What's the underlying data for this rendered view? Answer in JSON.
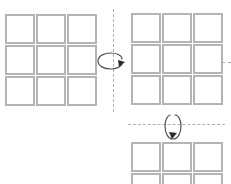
{
  "diagram": {
    "type": "cube-rotation-sequence",
    "background_color": "#ffffff",
    "grid_line_color": "#b4b4b4",
    "axis_line_color": "#b0b0b0",
    "arrow_color": "#333333",
    "grids": [
      {
        "id": "grid-start",
        "label": "",
        "rows": 3,
        "cols": 3,
        "x": 5,
        "y": 14,
        "width": 92,
        "height": 92,
        "clipped": false,
        "cells": [
          {
            "r": 0,
            "c": 0,
            "fill": "#ffffff"
          },
          {
            "r": 0,
            "c": 1,
            "fill": "#ffffff"
          },
          {
            "r": 0,
            "c": 2,
            "fill": "#ffffff"
          },
          {
            "r": 1,
            "c": 0,
            "fill": "#ffffff"
          },
          {
            "r": 1,
            "c": 1,
            "fill": "#ffffff"
          },
          {
            "r": 1,
            "c": 2,
            "fill": "#ffffff"
          },
          {
            "r": 2,
            "c": 0,
            "fill": "#ffffff"
          },
          {
            "r": 2,
            "c": 1,
            "fill": "#ffffff"
          },
          {
            "r": 2,
            "c": 2,
            "fill": "#ffffff"
          }
        ]
      },
      {
        "id": "grid-after-vertical-rotation",
        "label": "",
        "rows": 3,
        "cols": 3,
        "x": 131,
        "y": 13,
        "width": 92,
        "height": 92,
        "clipped": false,
        "cells": [
          {
            "r": 0,
            "c": 0,
            "fill": "#ffffff"
          },
          {
            "r": 0,
            "c": 1,
            "fill": "#ffffff"
          },
          {
            "r": 0,
            "c": 2,
            "fill": "#ffffff"
          },
          {
            "r": 1,
            "c": 0,
            "fill": "#ffffff"
          },
          {
            "r": 1,
            "c": 1,
            "fill": "#ffffff"
          },
          {
            "r": 1,
            "c": 2,
            "fill": "#ffffff"
          },
          {
            "r": 2,
            "c": 0,
            "fill": "#ffffff"
          },
          {
            "r": 2,
            "c": 1,
            "fill": "#ffffff"
          },
          {
            "r": 2,
            "c": 2,
            "fill": "#ffffff"
          }
        ]
      },
      {
        "id": "grid-after-horizontal-rotation",
        "label": "",
        "rows": 3,
        "cols": 3,
        "x": 131,
        "y": 142,
        "width": 92,
        "height": 92,
        "clipped": true,
        "cells": [
          {
            "r": 0,
            "c": 0,
            "fill": "#ffffff"
          },
          {
            "r": 0,
            "c": 1,
            "fill": "#ffffff"
          },
          {
            "r": 0,
            "c": 2,
            "fill": "#ffffff"
          },
          {
            "r": 1,
            "c": 0,
            "fill": "#ffffff"
          },
          {
            "r": 1,
            "c": 1,
            "fill": "#ffffff"
          },
          {
            "r": 1,
            "c": 2,
            "fill": "#ffffff"
          },
          {
            "r": 2,
            "c": 0,
            "fill": "#ffffff"
          },
          {
            "r": 2,
            "c": 1,
            "fill": "#ffffff"
          },
          {
            "r": 2,
            "c": 2,
            "fill": "#ffffff"
          }
        ]
      }
    ],
    "axes": [
      {
        "id": "vertical-rotation-axis",
        "orientation": "vertical",
        "x": 113,
        "y": 9,
        "length": 103,
        "style": "dashed"
      },
      {
        "id": "horizontal-rotation-axis",
        "orientation": "horizontal",
        "x": 128,
        "y": 124,
        "length": 97,
        "style": "dashed"
      },
      {
        "id": "right-edge-axis-stub",
        "orientation": "horizontal",
        "x": 222,
        "y": 62,
        "length": 9,
        "style": "dashed"
      }
    ],
    "arrows": [
      {
        "id": "rotate-vertical-arrow",
        "semantic": "rotate-about-vertical-axis",
        "x": 96,
        "y": 52,
        "width": 32,
        "height": 22,
        "shape": "flat-ellipse-arc",
        "direction": "clockwise-viewed-from-above"
      },
      {
        "id": "rotate-horizontal-arrow",
        "semantic": "rotate-about-horizontal-axis",
        "x": 161,
        "y": 110,
        "width": 22,
        "height": 32,
        "shape": "tall-ellipse-arc",
        "direction": "clockwise-viewed-from-right"
      }
    ]
  }
}
